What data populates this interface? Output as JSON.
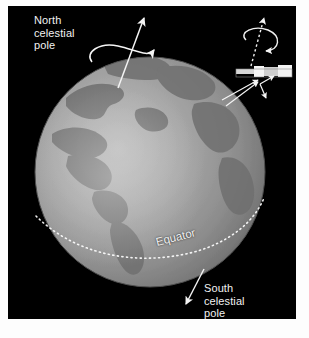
{
  "figure": {
    "background_color": "#000000",
    "page_color": "#ffffff",
    "globe_color": "#9a9a9a",
    "line_color": "#f2f2f2",
    "labels": {
      "north": "North\ncelestial\npole",
      "south": "South\ncelestial\npole",
      "equator": "Equator"
    },
    "icons": {
      "earth": "earth-globe-icon",
      "satellite": "satellite-telescope-icon",
      "north_axis": "rotation-axis-arrow-icon",
      "satellite_axis": "satellite-spin-axis-icon",
      "equator_line": "dotted-equator-line-icon",
      "south_pointer": "south-pole-pointer-icon"
    },
    "geography": [
      "North America",
      "South America",
      "Greenland",
      "Europe",
      "Africa"
    ]
  }
}
